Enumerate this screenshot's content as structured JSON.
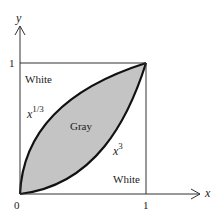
{
  "diagram": {
    "axes": {
      "x_label": "x",
      "y_label": "y",
      "origin_label": "0",
      "x_tick_label": "1",
      "y_tick_label": "1"
    },
    "regions": {
      "upper_white": "White",
      "lower_white": "White",
      "gray": "Gray"
    },
    "curves": {
      "upper": {
        "base": "x",
        "exponent": "1/3"
      },
      "lower": {
        "base": "x",
        "exponent": "3"
      }
    },
    "colors": {
      "gray_fill": "#c4c4c4",
      "stroke": "#111111"
    }
  }
}
